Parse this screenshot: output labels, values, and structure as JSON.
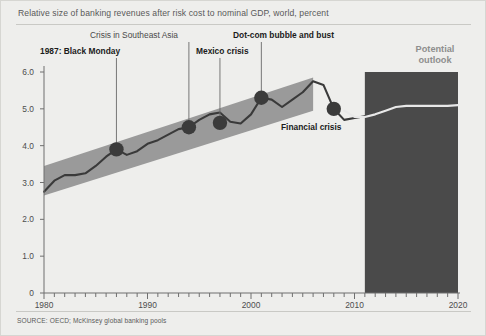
{
  "figure": {
    "title": "Relative size of banking revenues after risk cost to nominal GDP, world, percent",
    "source": "SOURCE: OECD; McKinsey global banking pools",
    "outlook_label_line1": "Potential",
    "outlook_label_line2": "outlook",
    "colors": {
      "background": "#eeeeec",
      "band": "#9a9a9a",
      "line": "#3a3a3a",
      "marker": "#3b3b3b",
      "outlook_panel": "#4a4a4a",
      "outlook_line": "#e8e8e8",
      "axis": "#6f6f6f",
      "title_text": "#595959",
      "annotation_text": "#1b1b1b",
      "annotation_text_light": "#4a4a4a",
      "outlook_text": "#8e8e8e"
    }
  },
  "annotations": [
    {
      "id": "black-monday",
      "label": "1987: Black Monday",
      "bold": true,
      "year": 1987,
      "value": 3.9
    },
    {
      "id": "sea-crisis",
      "label": "Crisis in Southeast Asia",
      "bold": false,
      "year": 1994,
      "value": 4.5
    },
    {
      "id": "mexico",
      "label": "Mexico crisis",
      "bold": true,
      "year": 1997,
      "value": 4.6
    },
    {
      "id": "dotcom",
      "label": "Dot-com bubble and bust",
      "bold": true,
      "year": 2001,
      "value": 5.3
    },
    {
      "id": "financial",
      "label": "Financial crisis",
      "bold": true,
      "year": 2008,
      "value": 5.0
    }
  ],
  "chart_data": {
    "type": "line",
    "title": "Relative size of banking revenues after risk cost to nominal GDP, world, percent",
    "xlabel": "",
    "ylabel": "percent",
    "xlim": [
      1980,
      2020
    ],
    "ylim": [
      0,
      6.0
    ],
    "xticks": [
      1980,
      1990,
      2000,
      2010,
      2020
    ],
    "xtick_labels": [
      "1980",
      "1990",
      "2000",
      "2010",
      "2020"
    ],
    "yticks": [
      0,
      1.0,
      2.0,
      3.0,
      4.0,
      5.0,
      6.0
    ],
    "ytick_labels": [
      "0",
      "1.0",
      "2.0",
      "3.0",
      "4.0",
      "5.0",
      "6.0"
    ],
    "minor_x_tick_interval": 1,
    "grid": false,
    "legend": null,
    "series": [
      {
        "name": "Banking revenues after risk cost / nominal GDP",
        "style": "solid-dark",
        "x": [
          1980,
          1981,
          1982,
          1983,
          1984,
          1985,
          1986,
          1987,
          1988,
          1989,
          1990,
          1991,
          1992,
          1993,
          1994,
          1995,
          1996,
          1997,
          1998,
          1999,
          2000,
          2001,
          2002,
          2003,
          2004,
          2005,
          2006,
          2007,
          2008,
          2009,
          2010,
          2011
        ],
        "values": [
          2.75,
          3.05,
          3.2,
          3.2,
          3.25,
          3.45,
          3.7,
          3.9,
          3.75,
          3.85,
          4.05,
          4.15,
          4.3,
          4.45,
          4.5,
          4.7,
          4.85,
          4.9,
          4.65,
          4.6,
          4.85,
          5.3,
          5.25,
          5.05,
          5.25,
          5.45,
          5.75,
          5.65,
          5.0,
          4.7,
          4.75,
          4.8
        ]
      },
      {
        "name": "Potential outlook",
        "style": "solid-light",
        "x": [
          2009,
          2010,
          2011,
          2012,
          2013,
          2014,
          2015,
          2016,
          2017,
          2018,
          2019,
          2020
        ],
        "values": [
          4.95,
          4.78,
          4.78,
          4.85,
          4.95,
          5.05,
          5.08,
          5.08,
          5.08,
          5.08,
          5.08,
          5.1
        ]
      }
    ],
    "band": {
      "name": "Long-term trend corridor",
      "x": [
        1980,
        2006
      ],
      "lower": [
        2.65,
        4.95
      ],
      "upper": [
        3.45,
        5.85
      ]
    },
    "markers": [
      {
        "label": "1987: Black Monday",
        "x": 1987,
        "y": 3.9
      },
      {
        "label": "Crisis in Southeast Asia",
        "x": 1994,
        "y": 4.5
      },
      {
        "label": "Mexico crisis",
        "x": 1997,
        "y": 4.62
      },
      {
        "label": "Dot-com bubble and bust",
        "x": 2001,
        "y": 5.3
      },
      {
        "label": "Financial crisis",
        "x": 2008,
        "y": 5.0
      }
    ],
    "shaded_region": {
      "name": "Potential outlook",
      "x_start": 2011,
      "x_end": 2020,
      "y_start": 0,
      "y_end": 6.0
    }
  }
}
